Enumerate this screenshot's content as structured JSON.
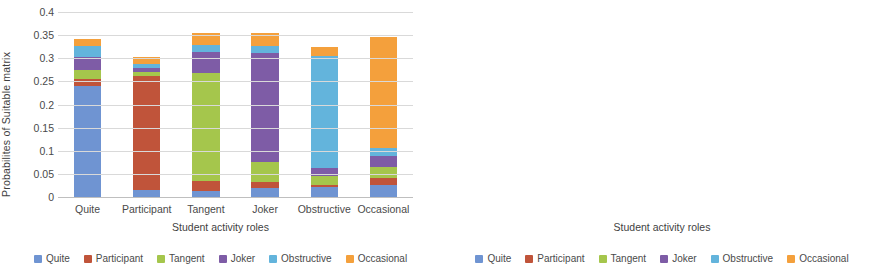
{
  "series_colors": {
    "Quite": "#6f94d2",
    "Participant": "#c0543a",
    "Tangent": "#a2c council",
    "Joker": "#7e5ca6",
    "Obstructive": "#63b4dc",
    "Occasional": "#f4a03c"
  },
  "palette": {
    "quite": "#6f94d2",
    "participant": "#c0543a",
    "tangent": "#a5c64c",
    "joker": "#7e5ca6",
    "obstructive": "#63b4dc",
    "occasional": "#f4a03c",
    "grid": "#d9d9d9",
    "axis": "#bfbfbf",
    "text": "#4a4a4a"
  },
  "legend": {
    "items": [
      {
        "label": "Quite",
        "color": "#6f94d2"
      },
      {
        "label": "Participant",
        "color": "#c0543a"
      },
      {
        "label": "Tangent",
        "color": "#a5c64c"
      },
      {
        "label": "Joker",
        "color": "#7e5ca6"
      },
      {
        "label": "Obstructive",
        "color": "#63b4dc"
      },
      {
        "label": "Occasional",
        "color": "#f4a03c"
      }
    ]
  },
  "chart_data": [
    {
      "type": "bar",
      "stacked": true,
      "title": "",
      "xlabel": "Student activity roles",
      "ylabel": "Probabilites  of Suitable  matrix",
      "categories": [
        "Quite",
        "Participant",
        "Tangent",
        "Joker",
        "Obstructive",
        "Occasional"
      ],
      "ylim": [
        0,
        0.4
      ],
      "yticks": [
        "0",
        "0.05",
        "0.1",
        "0.15",
        "0.2",
        "0.25",
        "0.3",
        "0.35",
        "0.4"
      ],
      "ytick_values": [
        0,
        0.05,
        0.1,
        0.15,
        0.2,
        0.25,
        0.3,
        0.35,
        0.4
      ],
      "grid": true,
      "legend_position": "bottom",
      "series": [
        {
          "name": "Quite",
          "color": "#6f94d2",
          "values": [
            0.241,
            0.016,
            0.014,
            0.019,
            0.022,
            0.026
          ]
        },
        {
          "name": "Participant",
          "color": "#c0543a",
          "values": [
            0.015,
            0.246,
            0.02,
            0.013,
            0.005,
            0.015
          ]
        },
        {
          "name": "Tangent",
          "color": "#a5c64c",
          "values": [
            0.018,
            0.009,
            0.235,
            0.044,
            0.019,
            0.024
          ]
        },
        {
          "name": "Joker",
          "color": "#7e5ca6",
          "values": [
            0.029,
            0.009,
            0.044,
            0.236,
            0.017,
            0.024
          ]
        },
        {
          "name": "Obstructive",
          "color": "#63b4dc",
          "values": [
            0.024,
            0.008,
            0.016,
            0.015,
            0.242,
            0.017
          ]
        },
        {
          "name": "Occasional",
          "color": "#f4a03c",
          "values": [
            0.015,
            0.015,
            0.025,
            0.027,
            0.02,
            0.239
          ]
        }
      ],
      "totals": [
        0.342,
        0.303,
        0.354,
        0.354,
        0.325,
        0.345
      ]
    },
    {
      "type": "bar",
      "stacked": true,
      "title": "",
      "xlabel": "Student activity roles",
      "ylabel": "Probabilites  of Unsuitable  matrix",
      "categories": [
        "Quite",
        "Participant",
        "Tangent",
        "Joker",
        "Obstructive",
        "Occasional"
      ],
      "ylim": [
        0,
        0.09
      ],
      "yticks": [
        "0",
        "0.01",
        "0.02",
        "0.03",
        "0.04",
        "0.05",
        "0.06",
        "0.07",
        "0.08",
        "0.09"
      ],
      "ytick_values": [
        0,
        0.01,
        0.02,
        0.03,
        0.04,
        0.05,
        0.06,
        0.07,
        0.08,
        0.09
      ],
      "grid": true,
      "legend_position": "bottom",
      "series": [
        {
          "name": "Quite",
          "color": "#6f94d2",
          "values": [
            0.005,
            0.011,
            0.01,
            0.01,
            0.01,
            0.01
          ]
        },
        {
          "name": "Participant",
          "color": "#c0543a",
          "values": [
            0.01,
            0.003,
            0.01,
            0.01,
            0.0,
            0.01
          ]
        },
        {
          "name": "Tangent",
          "color": "#a5c64c",
          "values": [
            0.01,
            0.011,
            0.003,
            0.017,
            0.011,
            0.02
          ]
        },
        {
          "name": "Joker",
          "color": "#7e5ca6",
          "values": [
            0.011,
            0.01,
            0.042,
            0.005,
            0.011,
            0.01
          ]
        },
        {
          "name": "Obstructive",
          "color": "#63b4dc",
          "values": [
            0.009,
            0.0,
            0.009,
            0.01,
            0.004,
            0.009
          ]
        },
        {
          "name": "Occasional",
          "color": "#f4a03c",
          "values": [
            0.01,
            0.01,
            0.01,
            0.009,
            0.01,
            0.006
          ]
        }
      ],
      "totals": [
        0.055,
        0.045,
        0.084,
        0.061,
        0.046,
        0.065
      ]
    }
  ]
}
